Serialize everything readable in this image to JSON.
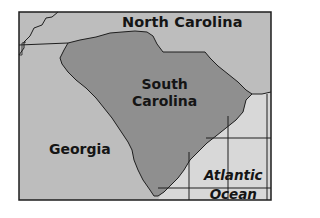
{
  "map": {
    "title": "",
    "colors": {
      "background": "#ffffff",
      "neighbor_states": "#bdbdbd",
      "south_carolina": "#8f8f8f",
      "ocean": "#d8d8d8",
      "borders": "#1e1e1e"
    },
    "labels": {
      "north_carolina": "North Carolina",
      "south_carolina_line1": "South",
      "south_carolina_line2": "Carolina",
      "georgia": "Georgia",
      "ocean_line1": "Atlantic",
      "ocean_line2": "Ocean"
    },
    "regions": [
      {
        "name": "North Carolina",
        "type": "state"
      },
      {
        "name": "South Carolina",
        "type": "state",
        "highlighted": true
      },
      {
        "name": "Georgia",
        "type": "state"
      },
      {
        "name": "Atlantic Ocean",
        "type": "water"
      }
    ]
  }
}
